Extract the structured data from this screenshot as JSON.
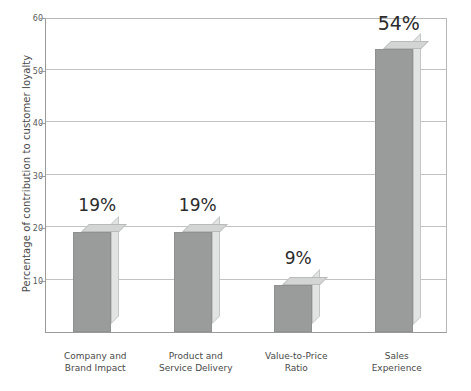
{
  "chart_data": {
    "type": "bar",
    "title": "",
    "xlabel": "",
    "ylabel": "Percentage of contribution to customer loyalty",
    "ylim": [
      0,
      60
    ],
    "yticks": [
      10,
      20,
      30,
      40,
      50,
      60
    ],
    "grid": true,
    "legend": "none",
    "categories": [
      "Company and\nBrand Impact",
      "Product and\nService Delivery",
      "Value-to-Price\nRatio",
      "Sales\nExperience"
    ],
    "category_lines": [
      [
        "Company and",
        "Brand Impact"
      ],
      [
        "Product and",
        "Service Delivery"
      ],
      [
        "Value-to-Price",
        "Ratio"
      ],
      [
        "Sales",
        "Experience"
      ]
    ],
    "values": [
      19,
      19,
      9,
      54
    ],
    "data_labels": [
      "19%",
      "19%",
      "9%",
      "54%"
    ],
    "bar_face_color": "#9a9c9b",
    "bar_top_color": "#d3d5d4",
    "bar_side_color": "#e2e4e3",
    "gridline_color": "#c2c2c2",
    "axis_color": "#9a9a9a",
    "background_color": "#ffffff"
  },
  "axis": {
    "y_title": "Percentage of contribution to customer loyalty",
    "y_tick_labels": [
      "10",
      "20",
      "30",
      "40",
      "50",
      "60"
    ]
  }
}
